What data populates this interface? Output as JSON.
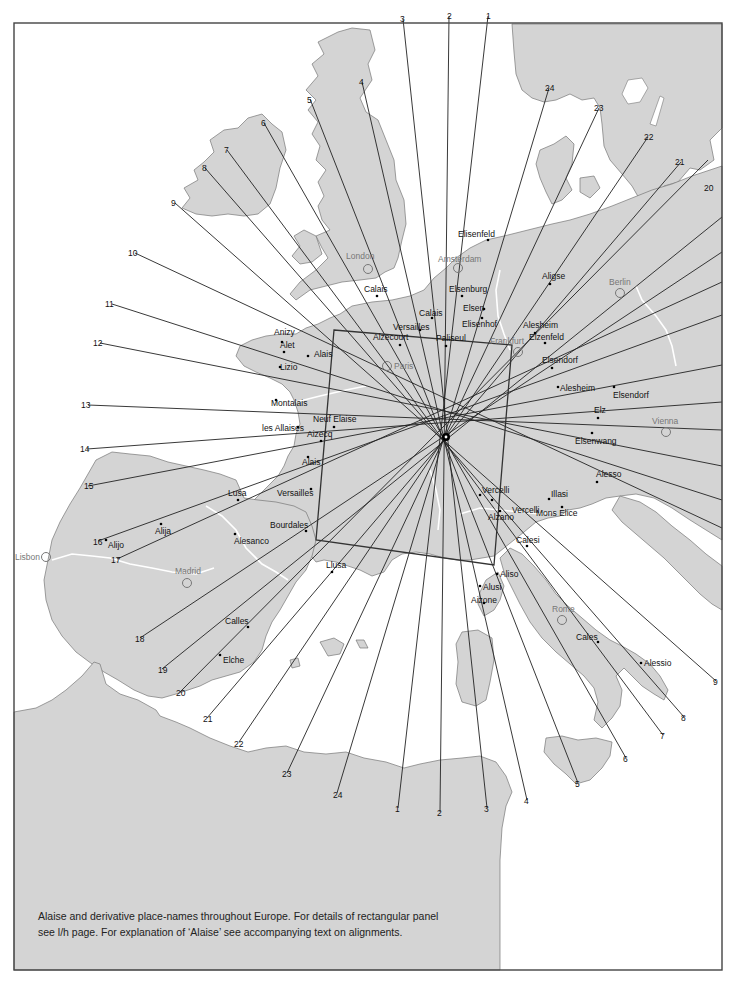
{
  "caption": {
    "line1": "Alaise and derivative place-names throughout Europe. For details of rectangular panel",
    "line2": "see l/h page. For explanation of ‘Alaise’ see accompanying text on alignments."
  },
  "colors": {
    "land": "#d4d4d4",
    "sea": "#ffffff",
    "coast": "#777777",
    "river": "#ffffff",
    "lines": "#222222",
    "frame": "#444444",
    "city_label": "#777777"
  },
  "center_point": {
    "x": 446,
    "y": 437
  },
  "rectangular_panel": {
    "corners": [
      [
        334,
        330
      ],
      [
        512,
        345
      ],
      [
        494,
        565
      ],
      [
        316,
        540
      ]
    ]
  },
  "alignments": [
    {
      "n": "1",
      "a": [
        488,
        16
      ],
      "b": [
        398,
        808
      ]
    },
    {
      "n": "2",
      "a": [
        449,
        16
      ],
      "b": [
        440,
        812
      ]
    },
    {
      "n": "3",
      "a": [
        403,
        19
      ],
      "b": [
        487,
        808
      ]
    },
    {
      "n": "4",
      "a": [
        362,
        82
      ],
      "b": [
        527,
        800
      ]
    },
    {
      "n": "5",
      "a": [
        310,
        99
      ],
      "b": [
        578,
        783
      ]
    },
    {
      "n": "6",
      "a": [
        264,
        123
      ],
      "b": [
        626,
        758
      ]
    },
    {
      "n": "7",
      "a": [
        227,
        150
      ],
      "b": [
        663,
        735
      ]
    },
    {
      "n": "8",
      "a": [
        205,
        168
      ],
      "b": [
        684,
        717
      ]
    },
    {
      "n": "9",
      "a": [
        175,
        203
      ],
      "b": [
        716,
        681
      ]
    },
    {
      "n": "10",
      "a": [
        135,
        253
      ],
      "b": [
        722,
        528
      ]
    },
    {
      "n": "11",
      "a": [
        112,
        304
      ],
      "b": [
        722,
        500
      ]
    },
    {
      "n": "12",
      "a": [
        100,
        343
      ],
      "b": [
        722,
        466
      ]
    },
    {
      "n": "13",
      "a": [
        88,
        405
      ],
      "b": [
        722,
        430
      ]
    },
    {
      "n": "14",
      "a": [
        87,
        449
      ],
      "b": [
        722,
        402
      ]
    },
    {
      "n": "15",
      "a": [
        88,
        486
      ],
      "b": [
        722,
        365
      ]
    },
    {
      "n": "16",
      "a": [
        98,
        541
      ],
      "b": [
        722,
        315
      ]
    },
    {
      "n": "17",
      "a": [
        117,
        559
      ],
      "b": [
        722,
        282
      ]
    },
    {
      "n": "18",
      "a": [
        140,
        638
      ],
      "b": [
        722,
        252
      ]
    },
    {
      "n": "19",
      "a": [
        162,
        669
      ],
      "b": [
        722,
        217
      ]
    },
    {
      "n": "20",
      "a": [
        180,
        692
      ],
      "b": [
        708,
        160
      ]
    },
    {
      "n": "21",
      "a": [
        207,
        718
      ],
      "b": [
        681,
        162
      ]
    },
    {
      "n": "22",
      "a": [
        239,
        742
      ],
      "b": [
        648,
        137
      ]
    },
    {
      "n": "23",
      "a": [
        287,
        773
      ],
      "b": [
        599,
        108
      ]
    },
    {
      "n": "24",
      "a": [
        337,
        793
      ],
      "b": [
        549,
        88
      ]
    }
  ],
  "edge_numbers": [
    {
      "n": "1",
      "x": 486,
      "y": 19
    },
    {
      "n": "2",
      "x": 447,
      "y": 19
    },
    {
      "n": "3",
      "x": 400,
      "y": 22
    },
    {
      "n": "4",
      "x": 359,
      "y": 85
    },
    {
      "n": "5",
      "x": 307,
      "y": 103
    },
    {
      "n": "6",
      "x": 261,
      "y": 126
    },
    {
      "n": "7",
      "x": 224,
      "y": 153
    },
    {
      "n": "8",
      "x": 202,
      "y": 171
    },
    {
      "n": "9",
      "x": 171,
      "y": 206
    },
    {
      "n": "10",
      "x": 128,
      "y": 256
    },
    {
      "n": "11",
      "x": 105,
      "y": 307
    },
    {
      "n": "12",
      "x": 93,
      "y": 346
    },
    {
      "n": "13",
      "x": 81,
      "y": 408
    },
    {
      "n": "14",
      "x": 80,
      "y": 452
    },
    {
      "n": "15",
      "x": 84,
      "y": 489
    },
    {
      "n": "16",
      "x": 93,
      "y": 545
    },
    {
      "n": "17",
      "x": 111,
      "y": 563
    },
    {
      "n": "18",
      "x": 135,
      "y": 642
    },
    {
      "n": "19",
      "x": 158,
      "y": 673
    },
    {
      "n": "20",
      "x": 176,
      "y": 696
    },
    {
      "n": "21",
      "x": 203,
      "y": 722
    },
    {
      "n": "22",
      "x": 234,
      "y": 747
    },
    {
      "n": "23",
      "x": 282,
      "y": 777
    },
    {
      "n": "24",
      "x": 333,
      "y": 798
    },
    {
      "n": "1",
      "x": 395,
      "y": 812
    },
    {
      "n": "2",
      "x": 437,
      "y": 816
    },
    {
      "n": "3",
      "x": 484,
      "y": 812
    },
    {
      "n": "4",
      "x": 524,
      "y": 804
    },
    {
      "n": "5",
      "x": 575,
      "y": 787
    },
    {
      "n": "6",
      "x": 623,
      "y": 762
    },
    {
      "n": "7",
      "x": 660,
      "y": 739
    },
    {
      "n": "8",
      "x": 681,
      "y": 721
    },
    {
      "n": "9",
      "x": 713,
      "y": 685
    },
    {
      "n": "20",
      "x": 704,
      "y": 191
    },
    {
      "n": "21",
      "x": 675,
      "y": 165
    },
    {
      "n": "22",
      "x": 644,
      "y": 140
    },
    {
      "n": "23",
      "x": 594,
      "y": 111
    },
    {
      "n": "24",
      "x": 545,
      "y": 91
    }
  ],
  "places": [
    {
      "name": "Elisenfeld",
      "x": 488,
      "y": 240,
      "dx": -30,
      "dy": -3
    },
    {
      "name": "Elsenburg",
      "x": 462,
      "y": 296,
      "dx": -13,
      "dy": -4
    },
    {
      "name": "Elsen",
      "x": 484,
      "y": 309,
      "dx": -21,
      "dy": 2
    },
    {
      "name": "Elisenhof",
      "x": 482,
      "y": 318,
      "dx": -20,
      "dy": 9
    },
    {
      "name": "Calais",
      "x": 377,
      "y": 296,
      "dx": -13,
      "dy": -4
    },
    {
      "name": "Calais",
      "x": 432,
      "y": 318,
      "dx": -13,
      "dy": -2
    },
    {
      "name": "Versailles",
      "x": 420,
      "y": 330,
      "dx": -27,
      "dy": 0
    },
    {
      "name": "Alzecourt",
      "x": 400,
      "y": 345,
      "dx": -27,
      "dy": -5
    },
    {
      "name": "Paliseul",
      "x": 446,
      "y": 346,
      "dx": -10,
      "dy": -5
    },
    {
      "name": "Aligse",
      "x": 550,
      "y": 284,
      "dx": -8,
      "dy": -5
    },
    {
      "name": "Alesheim",
      "x": 535,
      "y": 333,
      "dx": -12,
      "dy": -5
    },
    {
      "name": "Elzenfeld",
      "x": 545,
      "y": 343,
      "dx": -16,
      "dy": -3
    },
    {
      "name": "Elsendorf",
      "x": 552,
      "y": 368,
      "dx": -10,
      "dy": -5
    },
    {
      "name": "Alesheim",
      "x": 558,
      "y": 387,
      "dx": 2,
      "dy": 4
    },
    {
      "name": "Elsendorf",
      "x": 614,
      "y": 387,
      "dx": -1,
      "dy": 11
    },
    {
      "name": "Elz",
      "x": 598,
      "y": 418,
      "dx": -4,
      "dy": -5
    },
    {
      "name": "Elsenwang",
      "x": 592,
      "y": 433,
      "dx": -17,
      "dy": 11
    },
    {
      "name": "Alesso",
      "x": 597,
      "y": 482,
      "dx": -1,
      "dy": -5
    },
    {
      "name": "Illasi",
      "x": 549,
      "y": 499,
      "dx": 2,
      "dy": -2
    },
    {
      "name": "Mons Elice",
      "x": 562,
      "y": 507,
      "dx": -26,
      "dy": 9
    },
    {
      "name": "Vercelli",
      "x": 480,
      "y": 495,
      "dx": 2,
      "dy": -2
    },
    {
      "name": "Vercelli",
      "x": 492,
      "y": 500,
      "dx": 20,
      "dy": 13
    },
    {
      "name": "Alzano",
      "x": 500,
      "y": 511,
      "dx": -12,
      "dy": 9
    },
    {
      "name": "Calesi",
      "x": 527,
      "y": 546,
      "dx": -11,
      "dy": -3
    },
    {
      "name": "Aliso",
      "x": 497,
      "y": 574,
      "dx": 3,
      "dy": 3
    },
    {
      "name": "Alusi",
      "x": 480,
      "y": 586,
      "dx": 3,
      "dy": 4
    },
    {
      "name": "Aizone",
      "x": 484,
      "y": 603,
      "dx": -13,
      "dy": 0
    },
    {
      "name": "Cales",
      "x": 598,
      "y": 642,
      "dx": -22,
      "dy": -2
    },
    {
      "name": "Alessio",
      "x": 641,
      "y": 663,
      "dx": 3,
      "dy": 3
    },
    {
      "name": "Anizy",
      "x": 282,
      "y": 342,
      "dx": -8,
      "dy": -7
    },
    {
      "name": "Alet",
      "x": 284,
      "y": 352,
      "dx": -4,
      "dy": -4
    },
    {
      "name": "Alais",
      "x": 308,
      "y": 356,
      "dx": 6,
      "dy": 1
    },
    {
      "name": "Lizio",
      "x": 280,
      "y": 367,
      "dx": 0,
      "dy": 3
    },
    {
      "name": "Montalais",
      "x": 276,
      "y": 400,
      "dx": -5,
      "dy": 6
    },
    {
      "name": "Neuf Elaise",
      "x": 334,
      "y": 427,
      "dx": -21,
      "dy": -5
    },
    {
      "name": "les Allaises",
      "x": 298,
      "y": 427,
      "dx": -36,
      "dy": 4
    },
    {
      "name": "Aizecq",
      "x": 321,
      "y": 441,
      "dx": -14,
      "dy": -4
    },
    {
      "name": "Alais",
      "x": 308,
      "y": 457,
      "dx": -6,
      "dy": 8
    },
    {
      "name": "Versailles",
      "x": 311,
      "y": 489,
      "dx": -34,
      "dy": 7
    },
    {
      "name": "Lusa",
      "x": 238,
      "y": 500,
      "dx": -10,
      "dy": -4
    },
    {
      "name": "Bourdales",
      "x": 306,
      "y": 531,
      "dx": -36,
      "dy": -3
    },
    {
      "name": "Alija",
      "x": 161,
      "y": 524,
      "dx": -6,
      "dy": 10
    },
    {
      "name": "Alijo",
      "x": 106,
      "y": 540,
      "dx": 2,
      "dy": 8
    },
    {
      "name": "Alesanco",
      "x": 235,
      "y": 534,
      "dx": -1,
      "dy": 10
    },
    {
      "name": "Llusa",
      "x": 332,
      "y": 572,
      "dx": -6,
      "dy": -4
    },
    {
      "name": "Calles",
      "x": 248,
      "y": 627,
      "dx": -23,
      "dy": -3
    },
    {
      "name": "Elche",
      "x": 220,
      "y": 655,
      "dx": 3,
      "dy": 8
    }
  ],
  "cities": [
    {
      "name": "London",
      "x": 368,
      "y": 269,
      "dx": -22,
      "dy": -10
    },
    {
      "name": "Amsterdam",
      "x": 458,
      "y": 268,
      "dx": -20,
      "dy": -6
    },
    {
      "name": "Berlin",
      "x": 620,
      "y": 293,
      "dx": -11,
      "dy": -8
    },
    {
      "name": "Frankfurt",
      "x": 518,
      "y": 352,
      "dx": -28,
      "dy": -8
    },
    {
      "name": "Paris",
      "x": 387,
      "y": 366,
      "dx": 7,
      "dy": 3
    },
    {
      "name": "Vienna",
      "x": 666,
      "y": 432,
      "dx": -14,
      "dy": -8
    },
    {
      "name": "Madrid",
      "x": 187,
      "y": 583,
      "dx": -12,
      "dy": -9
    },
    {
      "name": "Lisbon",
      "x": 46,
      "y": 557,
      "dx": -31,
      "dy": 3
    },
    {
      "name": "Rome",
      "x": 562,
      "y": 620,
      "dx": -10,
      "dy": -8
    }
  ]
}
